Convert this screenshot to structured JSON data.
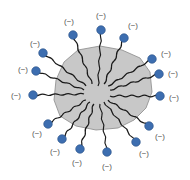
{
  "diagram": {
    "type": "micelle",
    "colors": {
      "core_fill": "#c8c8c8",
      "core_stroke": "#8a8a8a",
      "tail": "#1a1a1a",
      "head_fill": "#3d6eb0",
      "head_stroke": "#274f85",
      "label": "#555555",
      "background": "#ffffff"
    },
    "core": {
      "points": "78,50 100,46 122,50 140,58 150,72 152,92 146,108 134,120 118,128 96,130 76,126 60,116 54,100 56,80 64,62"
    },
    "molecules": [
      {
        "id": "top",
        "head": [
          101,
          30
        ],
        "tail_end": [
          98,
          86
        ],
        "label": "(−)",
        "label_pos": [
          101,
          16
        ]
      },
      {
        "id": "top-left",
        "head": [
          73,
          35
        ],
        "tail_end": [
          92,
          84
        ],
        "label": "(−)",
        "label_pos": [
          69,
          22
        ]
      },
      {
        "id": "top-right",
        "head": [
          124,
          38
        ],
        "tail_end": [
          104,
          84
        ],
        "label": "(−)",
        "label_pos": [
          133,
          26
        ]
      },
      {
        "id": "left-1",
        "head": [
          43,
          53
        ],
        "tail_end": [
          86,
          86
        ],
        "label": "(−)",
        "label_pos": [
          35,
          44
        ]
      },
      {
        "id": "left-2",
        "head": [
          36,
          71
        ],
        "tail_end": [
          84,
          90
        ],
        "label": "(−)",
        "label_pos": [
          23,
          70
        ]
      },
      {
        "id": "left-3",
        "head": [
          33,
          95
        ],
        "tail_end": [
          84,
          94
        ],
        "label": "(−)",
        "label_pos": [
          16,
          96
        ]
      },
      {
        "id": "right-1",
        "head": [
          152,
          59
        ],
        "tail_end": [
          108,
          86
        ],
        "label": "(−)",
        "label_pos": [
          166,
          54
        ]
      },
      {
        "id": "right-2",
        "head": [
          159,
          74
        ],
        "tail_end": [
          110,
          90
        ],
        "label": "(−)",
        "label_pos": [
          173,
          74
        ]
      },
      {
        "id": "right-3",
        "head": [
          160,
          96
        ],
        "tail_end": [
          110,
          96
        ],
        "label": "(−)",
        "label_pos": [
          174,
          98
        ]
      },
      {
        "id": "bottom-l1",
        "head": [
          48,
          124
        ],
        "tail_end": [
          86,
          100
        ],
        "label": "(−)",
        "label_pos": [
          37,
          134
        ]
      },
      {
        "id": "bottom-l2",
        "head": [
          62,
          139
        ],
        "tail_end": [
          90,
          102
        ],
        "label": "(−)",
        "label_pos": [
          55,
          152
        ]
      },
      {
        "id": "bottom-l3",
        "head": [
          80,
          149
        ],
        "tail_end": [
          94,
          104
        ],
        "label": "(−)",
        "label_pos": [
          77,
          163
        ]
      },
      {
        "id": "bottom",
        "head": [
          107,
          152
        ],
        "tail_end": [
          100,
          104
        ],
        "label": "(−)",
        "label_pos": [
          107,
          167
        ]
      },
      {
        "id": "bottom-r1",
        "head": [
          136,
          142
        ],
        "tail_end": [
          104,
          102
        ],
        "label": "(−)",
        "label_pos": [
          144,
          154
        ]
      },
      {
        "id": "bottom-r2",
        "head": [
          149,
          126
        ],
        "tail_end": [
          108,
          100
        ],
        "label": "(−)",
        "label_pos": [
          160,
          137
        ]
      }
    ]
  }
}
